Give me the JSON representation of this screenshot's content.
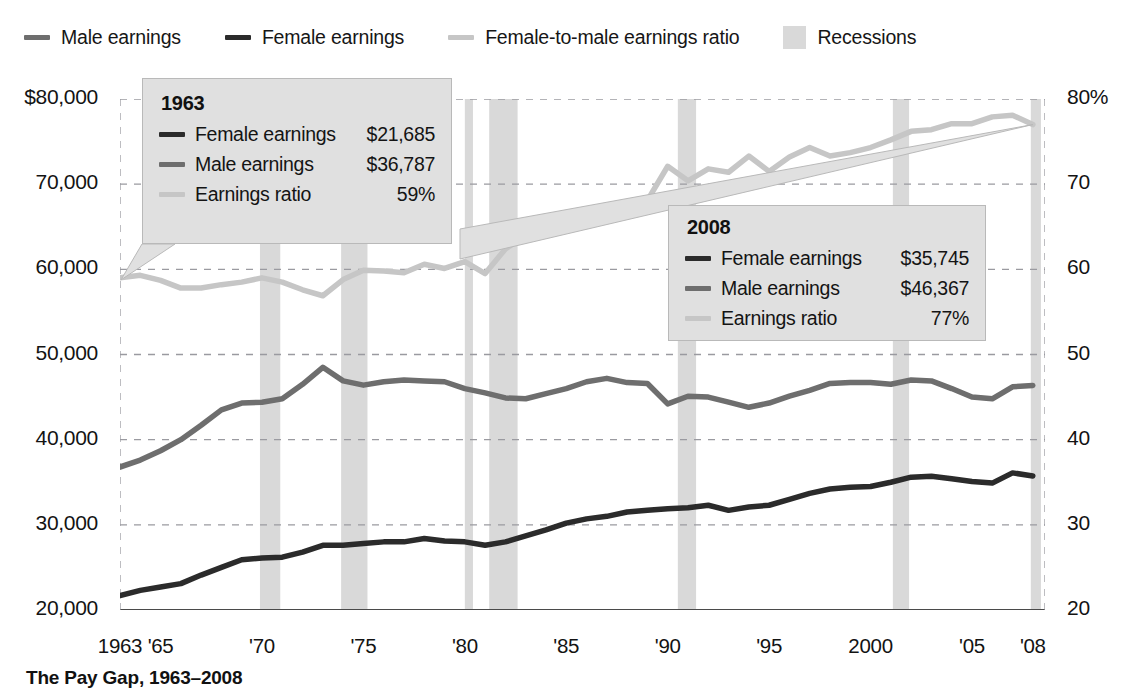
{
  "legend": {
    "items": [
      {
        "label": "Male earnings",
        "swatch": "line",
        "color": "#6e6e6e",
        "icon": "line-swatch-icon"
      },
      {
        "label": "Female earnings",
        "swatch": "line",
        "color": "#2b2b2b",
        "icon": "line-swatch-icon"
      },
      {
        "label": "Female-to-male earnings ratio",
        "swatch": "line",
        "color": "#c6c6c6",
        "icon": "line-swatch-icon"
      },
      {
        "label": "Recessions",
        "swatch": "block",
        "color": "#d9d9d9",
        "icon": "block-swatch-icon"
      }
    ]
  },
  "caption": "The Pay Gap, 1963–2008",
  "callouts": [
    {
      "id": "callout-1963",
      "title": "1963",
      "rows": [
        {
          "label": "Female earnings",
          "value": "$21,685",
          "color": "#2b2b2b"
        },
        {
          "label": "Male earnings",
          "value": "$36,787",
          "color": "#6e6e6e"
        },
        {
          "label": "Earnings ratio",
          "value": "59%",
          "color": "#c6c6c6"
        }
      ]
    },
    {
      "id": "callout-2008",
      "title": "2008",
      "rows": [
        {
          "label": "Female earnings",
          "value": "$35,745",
          "color": "#2b2b2b"
        },
        {
          "label": "Male earnings",
          "value": "$46,367",
          "color": "#6e6e6e"
        },
        {
          "label": "Earnings ratio",
          "value": "77%",
          "color": "#c6c6c6"
        }
      ]
    }
  ],
  "chart_data": {
    "type": "line",
    "title": "The Pay Gap, 1963–2008",
    "xlabel": "",
    "ylabel": "",
    "grid": true,
    "legend_position": "top",
    "x": [
      1963,
      1964,
      1965,
      1966,
      1967,
      1968,
      1969,
      1970,
      1971,
      1972,
      1973,
      1974,
      1975,
      1976,
      1977,
      1978,
      1979,
      1980,
      1981,
      1982,
      1983,
      1984,
      1985,
      1986,
      1987,
      1988,
      1989,
      1990,
      1991,
      1992,
      1993,
      1994,
      1995,
      1996,
      1997,
      1998,
      1999,
      2000,
      2001,
      2002,
      2003,
      2004,
      2005,
      2006,
      2007,
      2008
    ],
    "xtick_labels": [
      "1963",
      "'65",
      "'70",
      "'75",
      "'80",
      "'85",
      "'90",
      "'95",
      "2000",
      "'05",
      "'08"
    ],
    "xtick_values": [
      1963,
      1965,
      1970,
      1975,
      1980,
      1985,
      1990,
      1995,
      2000,
      2005,
      2008
    ],
    "axes": {
      "left": {
        "label": "",
        "ticks": [
          "$80,000",
          "70,000",
          "60,000",
          "50,000",
          "40,000",
          "30,000",
          "20,000"
        ],
        "tick_values": [
          80000,
          70000,
          60000,
          50000,
          40000,
          30000,
          20000
        ],
        "ylim": [
          20000,
          80000
        ]
      },
      "right": {
        "label": "",
        "ticks": [
          "80%",
          "70",
          "60",
          "50",
          "40",
          "30",
          "20"
        ],
        "tick_values": [
          80,
          70,
          60,
          50,
          40,
          30,
          20
        ],
        "ylim": [
          20,
          80
        ]
      }
    },
    "series": [
      {
        "name": "Male earnings",
        "color": "#6e6e6e",
        "axis": "left",
        "units": "2008 dollars",
        "values": [
          36787,
          37600,
          38700,
          40000,
          41700,
          43500,
          44300,
          44400,
          44800,
          46500,
          48500,
          46900,
          46400,
          46800,
          47000,
          46900,
          46800,
          46000,
          45500,
          44900,
          44800,
          45400,
          46000,
          46800,
          47200,
          46700,
          46600,
          44200,
          45100,
          45000,
          44400,
          43800,
          44300,
          45100,
          45800,
          46600,
          46700,
          46700,
          46500,
          47000,
          46900,
          46000,
          45000,
          44800,
          46200,
          46367
        ]
      },
      {
        "name": "Female earnings",
        "color": "#2b2b2b",
        "axis": "left",
        "units": "2008 dollars",
        "values": [
          21685,
          22300,
          22700,
          23100,
          24100,
          25000,
          25900,
          26100,
          26200,
          26800,
          27600,
          27600,
          27800,
          28000,
          28000,
          28400,
          28100,
          28000,
          27600,
          28000,
          28700,
          29400,
          30200,
          30700,
          31000,
          31500,
          31700,
          31900,
          32000,
          32300,
          31700,
          32100,
          32300,
          33000,
          33700,
          34200,
          34400,
          34500,
          35000,
          35600,
          35700,
          35400,
          35100,
          34900,
          36100,
          35745
        ]
      },
      {
        "name": "Female-to-male earnings ratio",
        "color": "#c6c6c6",
        "axis": "right",
        "units": "percent",
        "values": [
          59,
          59.3,
          58.7,
          57.8,
          57.8,
          58.2,
          58.5,
          59,
          58.5,
          57.6,
          56.9,
          58.8,
          59.9,
          59.8,
          59.6,
          60.6,
          60.1,
          60.9,
          59.5,
          62.4,
          64,
          64.8,
          65.6,
          65.6,
          65.7,
          67.4,
          68.1,
          72.1,
          70.4,
          71.8,
          71.4,
          73.3,
          71.5,
          73.2,
          74.3,
          73.3,
          73.7,
          74.3,
          75.2,
          76.2,
          76.4,
          77.1,
          77.1,
          77.9,
          78.1,
          77
        ]
      }
    ],
    "recessions": [
      {
        "start": 1969.9,
        "end": 1970.9
      },
      {
        "start": 1973.9,
        "end": 1975.2
      },
      {
        "start": 1980.0,
        "end": 1980.4
      },
      {
        "start": 1981.2,
        "end": 1982.6
      },
      {
        "start": 1990.5,
        "end": 1991.4
      },
      {
        "start": 2001.1,
        "end": 2001.9
      },
      {
        "start": 2007.9,
        "end": 2008.4
      }
    ],
    "annotations": [
      {
        "year": 1963,
        "female_earnings": 21685,
        "male_earnings": 36787,
        "ratio": 59
      },
      {
        "year": 2008,
        "female_earnings": 35745,
        "male_earnings": 46367,
        "ratio": 77
      }
    ]
  }
}
